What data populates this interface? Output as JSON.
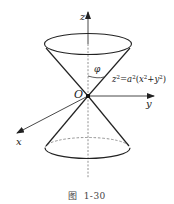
{
  "figure": {
    "caption_prefix": "图",
    "caption_number": "1-30",
    "labels": {
      "z_axis": "z",
      "y_axis": "y",
      "x_axis": "x",
      "origin": "O",
      "angle": "φ"
    },
    "equation": {
      "lhs_var": "z",
      "lhs_exp": "2",
      "eq": "=",
      "coef": "a",
      "coef_exp": "2",
      "open": "(",
      "x": "x",
      "x_exp": "2",
      "plus": "+",
      "y": "y",
      "y_exp": "2",
      "close": ")"
    },
    "colors": {
      "stroke": "#222222",
      "axis": "#333333",
      "dashed": "#777777"
    }
  }
}
